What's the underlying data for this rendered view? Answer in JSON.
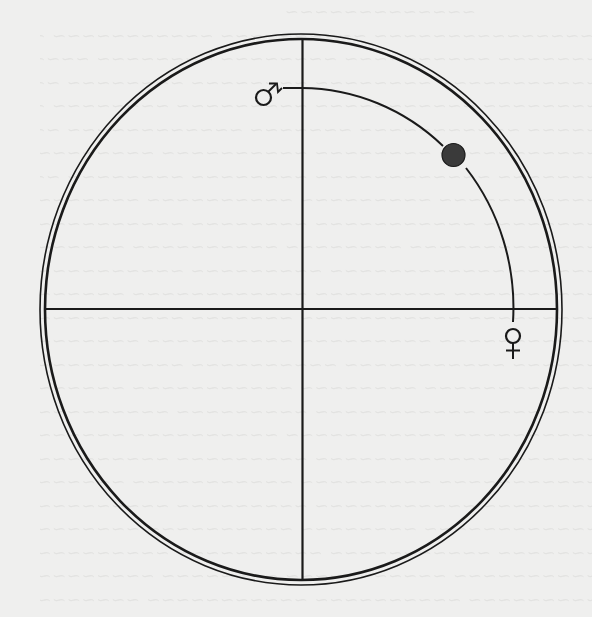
{
  "diagram": {
    "type": "orbit-diagram",
    "outer_circle": {
      "cx": 301,
      "cy": 309.5,
      "rx": 261,
      "ry": 275,
      "double_ring": true
    },
    "axes": {
      "vertical_x": 302,
      "horizontal_y": 309
    },
    "arc": {
      "cx": 302,
      "cy": 309,
      "rx": 211,
      "ry": 221,
      "start": [
        283,
        88
      ],
      "end": [
        513,
        322
      ]
    },
    "planet_dot": {
      "cx": 453,
      "cy": 154,
      "r": 12,
      "color": "#3a3a3a"
    },
    "symbols": [
      {
        "name": "mars",
        "glyph": "♂",
        "x": 264,
        "y": 97
      },
      {
        "name": "venus",
        "glyph": "♀",
        "x": 513,
        "y": 345
      }
    ]
  },
  "colors": {
    "background": "#efefee",
    "ink": "#1a1a1a",
    "bleed_through": "#d9d9d7"
  }
}
